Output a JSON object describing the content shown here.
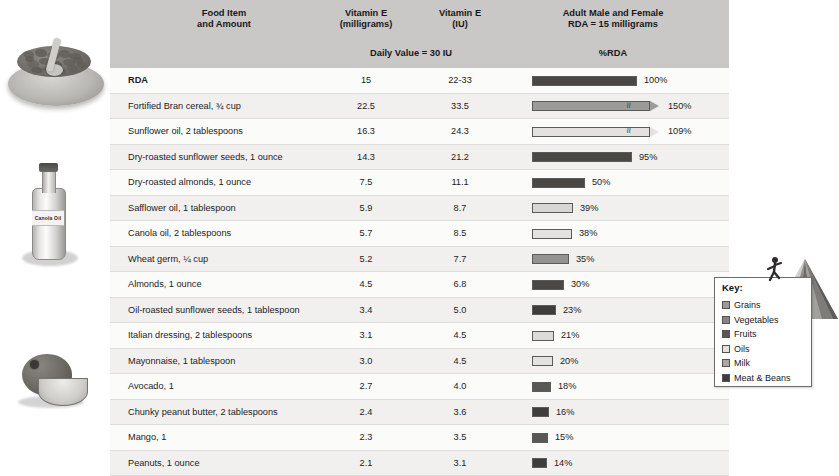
{
  "header": {
    "col_food": "Food Item\nand Amount",
    "col_food_l1": "Food Item",
    "col_food_l2": "and Amount",
    "col_mg_l1": "Vitamin E",
    "col_mg_l2": "(milligrams)",
    "col_iu_l1": "Vitamin E",
    "col_iu_l2": "(IU)",
    "col_rda_l1": "Adult Male and Female",
    "col_rda_l2": "RDA = 15 milligrams",
    "daily_value": "Daily Value = 30 IU",
    "pct_rda": "%RDA"
  },
  "illustrations": {
    "cereal_bowl": "cereal-bowl-image",
    "oil_bottle_label": "Canola Oil",
    "avocado": "avocado-image",
    "pyramid": "food-pyramid-image"
  },
  "legend": {
    "title": "Key:",
    "items": [
      {
        "label": "Grains",
        "color": "#9d9b98"
      },
      {
        "label": "Vegetables",
        "color": "#888683"
      },
      {
        "label": "Fruits",
        "color": "#5a5855"
      },
      {
        "label": "Oils",
        "color": "#e3e2e0"
      },
      {
        "label": "Milk",
        "color": "#a9a7a4"
      },
      {
        "label": "Meat & Beans",
        "color": "#3f3d3b"
      }
    ]
  },
  "chart_data": {
    "type": "bar",
    "xlabel": "%RDA",
    "ylabel": "Food Item and Amount",
    "columns": [
      "Food Item and Amount",
      "Vitamin E (milligrams)",
      "Vitamin E (IU)",
      "%RDA"
    ],
    "scale_px_per_100pct": 105,
    "rows": [
      {
        "food": "RDA",
        "mg": "15",
        "iu": "22-33",
        "pct": 100,
        "pct_label": "100%",
        "group": "Meat & Beans",
        "color": "#4a4845",
        "bar_width": 105,
        "truncated": false
      },
      {
        "food": "Fortified Bran cereal, ¾ cup",
        "mg": "22.5",
        "iu": "33.5",
        "pct": 150,
        "pct_label": "150%",
        "group": "Grains",
        "color": "#9d9b98",
        "bar_width": 118,
        "truncated": true
      },
      {
        "food": "Sunflower oil, 2 tablespoons",
        "mg": "16.3",
        "iu": "24.3",
        "pct": 109,
        "pct_label": "109%",
        "group": "Oils",
        "color": "#e3e2e0",
        "bar_width": 118,
        "truncated": true
      },
      {
        "food": "Dry-roasted sunflower seeds, 1 ounce",
        "mg": "14.3",
        "iu": "21.2",
        "pct": 95,
        "pct_label": "95%",
        "group": "Meat & Beans",
        "color": "#4a4845",
        "bar_width": 100,
        "truncated": false
      },
      {
        "food": "Dry-roasted almonds, 1 ounce",
        "mg": "7.5",
        "iu": "11.1",
        "pct": 50,
        "pct_label": "50%",
        "group": "Meat & Beans",
        "color": "#4a4845",
        "bar_width": 53,
        "truncated": false
      },
      {
        "food": "Safflower oil, 1 tablespoon",
        "mg": "5.9",
        "iu": "8.7",
        "pct": 39,
        "pct_label": "39%",
        "group": "Oils",
        "color": "#d9d7d4",
        "bar_width": 41,
        "truncated": false
      },
      {
        "food": "Canola oil, 2 tablespoons",
        "mg": "5.7",
        "iu": "8.5",
        "pct": 38,
        "pct_label": "38%",
        "group": "Oils",
        "color": "#e3e2e0",
        "bar_width": 40,
        "truncated": false
      },
      {
        "food": "Wheat germ, ¼ cup",
        "mg": "5.2",
        "iu": "7.7",
        "pct": 35,
        "pct_label": "35%",
        "group": "Grains",
        "color": "#949290",
        "bar_width": 37,
        "truncated": false
      },
      {
        "food": "Almonds, 1 ounce",
        "mg": "4.5",
        "iu": "6.8",
        "pct": 30,
        "pct_label": "30%",
        "group": "Meat & Beans",
        "color": "#4a4845",
        "bar_width": 32,
        "truncated": false
      },
      {
        "food": "Oil-roasted sunflower seeds, 1 tablespoon",
        "mg": "3.4",
        "iu": "5.0",
        "pct": 23,
        "pct_label": "23%",
        "group": "Meat & Beans",
        "color": "#3f3d3b",
        "bar_width": 24,
        "truncated": false
      },
      {
        "food": "Italian dressing, 2 tablespoons",
        "mg": "3.1",
        "iu": "4.5",
        "pct": 21,
        "pct_label": "21%",
        "group": "Oils",
        "color": "#dddbd9",
        "bar_width": 22,
        "truncated": false
      },
      {
        "food": "Mayonnaise, 1 tablespoon",
        "mg": "3.0",
        "iu": "4.5",
        "pct": 20,
        "pct_label": "20%",
        "group": "Oils",
        "color": "#e3e2e0",
        "bar_width": 21,
        "truncated": false
      },
      {
        "food": "Avocado, 1",
        "mg": "2.7",
        "iu": "4.0",
        "pct": 18,
        "pct_label": "18%",
        "group": "Fruits",
        "color": "#5a5855",
        "bar_width": 19,
        "truncated": false
      },
      {
        "food": "Chunky peanut butter, 2 tablespoons",
        "mg": "2.4",
        "iu": "3.6",
        "pct": 16,
        "pct_label": "16%",
        "group": "Meat & Beans",
        "color": "#3f3d3b",
        "bar_width": 17,
        "truncated": false
      },
      {
        "food": "Mango, 1",
        "mg": "2.3",
        "iu": "3.5",
        "pct": 15,
        "pct_label": "15%",
        "group": "Fruits",
        "color": "#5a5855",
        "bar_width": 16,
        "truncated": false
      },
      {
        "food": "Peanuts, 1 ounce",
        "mg": "2.1",
        "iu": "3.1",
        "pct": 14,
        "pct_label": "14%",
        "group": "Meat & Beans",
        "color": "#3f3d3b",
        "bar_width": 15,
        "truncated": false
      }
    ]
  }
}
